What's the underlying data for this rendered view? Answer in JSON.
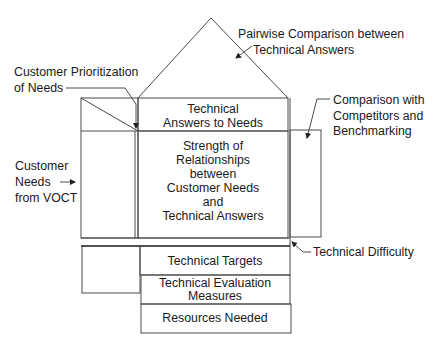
{
  "diagram": {
    "roof_label": [
      "Pairwise Comparison between",
      "Technical Answers"
    ],
    "prioritization_label": [
      "Customer Prioritization",
      "of Needs"
    ],
    "customer_needs_label": [
      "Customer",
      "Needs",
      "from VOCT"
    ],
    "competitor_label": [
      "Comparison with",
      "Competitors and",
      "Benchmarking"
    ],
    "technical_difficulty_label": "Technical Difficulty",
    "rooms": {
      "technical_answers": [
        "Technical",
        "Answers to Needs"
      ],
      "relationships": [
        "Strength of",
        "Relationships",
        "between",
        "Customer Needs",
        "and",
        "Technical Answers"
      ],
      "technical_targets": "Technical Targets",
      "evaluation": [
        "Technical Evaluation",
        "Measures"
      ],
      "resources": "Resources Needed"
    }
  }
}
